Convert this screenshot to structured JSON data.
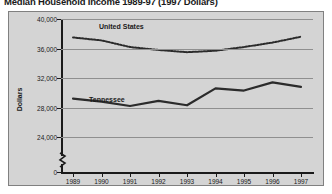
{
  "chart_data": {
    "type": "line",
    "title": "Median Household Income 1989-97 (1997 Dollars)",
    "xlabel": "",
    "ylabel": "Dollars",
    "x": [
      1989,
      1990,
      1991,
      1992,
      1993,
      1994,
      1995,
      1996,
      1997
    ],
    "xtick_labels": [
      "1989",
      "1990",
      "1991",
      "1992",
      "1993",
      "1994",
      "1995",
      "1996",
      "1997"
    ],
    "ytick_labels": [
      "0",
      "24,000",
      "28,000",
      "32,000",
      "36,000",
      "40,000"
    ],
    "ytick_values": [
      0,
      24000,
      28000,
      32000,
      36000,
      40000
    ],
    "ylim": [
      24000,
      40000
    ],
    "y_axis_break": true,
    "y_axis_break_symbol": "zigzag",
    "grid": true,
    "grid_axis": "y",
    "legend_position": "inline-labels",
    "series": [
      {
        "name": "United States",
        "style": "dotted",
        "color": "#2b2b2b",
        "values": [
          37500,
          37100,
          36200,
          35800,
          35500,
          35700,
          36200,
          36800,
          37600
        ]
      },
      {
        "name": "Tennessee",
        "style": "solid",
        "color": "#2b2b2b",
        "values": [
          29200,
          28800,
          28200,
          28900,
          28300,
          30600,
          30300,
          31400,
          30800
        ]
      }
    ]
  },
  "labels": {
    "united_states": "United States",
    "tennessee": "Tennessee"
  }
}
